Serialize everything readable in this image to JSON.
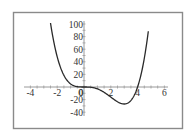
{
  "chart_data": {
    "type": "line",
    "title": "",
    "xlabel": "",
    "ylabel": "",
    "function": "x^4 - 4x^3",
    "xlim": [
      -4,
      6
    ],
    "ylim": [
      -40,
      100
    ],
    "grid": false,
    "legend": null,
    "x_ticks": [
      "-4",
      "-2",
      "0",
      "2",
      "4",
      "6"
    ],
    "y_ticks": [
      "100",
      "80",
      "60",
      "40",
      "20",
      "0",
      "-20",
      "-40"
    ],
    "series": [
      {
        "name": "f(x)",
        "x": [
          -2.5,
          -2,
          -1.5,
          -1,
          -0.5,
          0,
          0.5,
          1,
          1.5,
          2,
          2.5,
          3,
          3.5,
          4,
          4.5,
          4.8
        ],
        "values": [
          101.6,
          48,
          18.6,
          5,
          0.6,
          0,
          -0.4,
          -3,
          -8.4,
          -16,
          -23.4,
          -27,
          -21.4,
          0,
          45.6,
          88.5
        ]
      }
    ],
    "colors": {
      "curve": "#2a2a2a",
      "axis": "#9a9a9a",
      "frame": "#8a8a8a"
    }
  }
}
